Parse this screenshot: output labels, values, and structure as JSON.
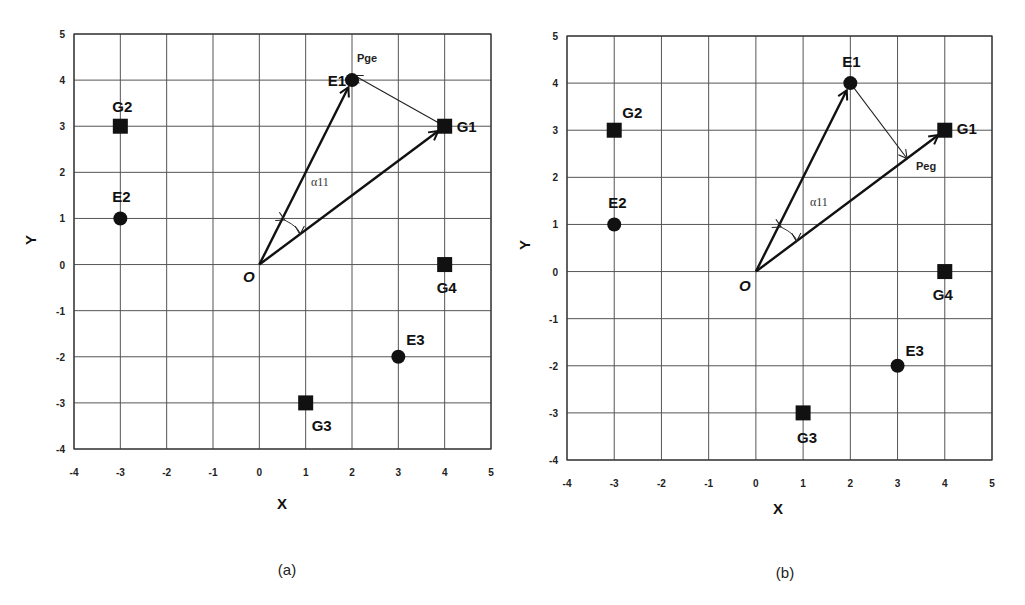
{
  "chart_data": [
    {
      "type": "scatter",
      "panel": "(a)",
      "title": "",
      "xlabel": "X",
      "ylabel": "Y",
      "xlim": [
        -4,
        5
      ],
      "ylim": [
        -4,
        5
      ],
      "xticks": [
        -4,
        -3,
        -2,
        -1,
        0,
        1,
        2,
        3,
        4,
        5
      ],
      "yticks": [
        -4,
        -3,
        -2,
        -1,
        0,
        1,
        2,
        3,
        4,
        5
      ],
      "grid": true,
      "origin_label": "O",
      "points": [
        {
          "label": "E1",
          "x": 2,
          "y": 4,
          "marker": "circle"
        },
        {
          "label": "E2",
          "x": -3,
          "y": 1,
          "marker": "circle"
        },
        {
          "label": "E3",
          "x": 3,
          "y": -2,
          "marker": "circle"
        },
        {
          "label": "G1",
          "x": 4,
          "y": 3,
          "marker": "square"
        },
        {
          "label": "G2",
          "x": -3,
          "y": 3,
          "marker": "square"
        },
        {
          "label": "G3",
          "x": 1,
          "y": -3,
          "marker": "square"
        },
        {
          "label": "G4",
          "x": 4,
          "y": 0,
          "marker": "square"
        }
      ],
      "vectors": [
        {
          "from": [
            0,
            0
          ],
          "to": [
            2,
            4
          ],
          "style": "bold"
        },
        {
          "from": [
            0,
            0
          ],
          "to": [
            4,
            3
          ],
          "style": "bold"
        },
        {
          "from": [
            4,
            3
          ],
          "to": [
            2.05,
            4.1
          ],
          "style": "thin",
          "label": "Pge"
        }
      ],
      "angle_label": "α11"
    },
    {
      "type": "scatter",
      "panel": "(b)",
      "title": "",
      "xlabel": "X",
      "ylabel": "Y",
      "xlim": [
        -4,
        5
      ],
      "ylim": [
        -4,
        5
      ],
      "xticks": [
        -4,
        -3,
        -2,
        -1,
        0,
        1,
        2,
        3,
        4,
        5
      ],
      "yticks": [
        -4,
        -3,
        -2,
        -1,
        0,
        1,
        2,
        3,
        4,
        5
      ],
      "grid": true,
      "origin_label": "O",
      "points": [
        {
          "label": "E1",
          "x": 2,
          "y": 4,
          "marker": "circle"
        },
        {
          "label": "E2",
          "x": -3,
          "y": 1,
          "marker": "circle"
        },
        {
          "label": "E3",
          "x": 3,
          "y": -2,
          "marker": "circle"
        },
        {
          "label": "G1",
          "x": 4,
          "y": 3,
          "marker": "square"
        },
        {
          "label": "G2",
          "x": -3,
          "y": 3,
          "marker": "square"
        },
        {
          "label": "G3",
          "x": 1,
          "y": -3,
          "marker": "square"
        },
        {
          "label": "G4",
          "x": 4,
          "y": 0,
          "marker": "square"
        }
      ],
      "vectors": [
        {
          "from": [
            0,
            0
          ],
          "to": [
            2,
            4
          ],
          "style": "bold"
        },
        {
          "from": [
            0,
            0
          ],
          "to": [
            4,
            3
          ],
          "style": "bold"
        },
        {
          "from": [
            2,
            4
          ],
          "to": [
            3.2,
            2.4
          ],
          "style": "thin",
          "label": "Peg"
        }
      ],
      "angle_label": "α11"
    }
  ],
  "captions": {
    "a": "(a)",
    "b": "(b)"
  }
}
